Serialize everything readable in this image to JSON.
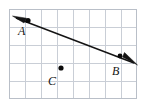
{
  "figure": {
    "colors": {
      "grid_line": "#c9ced6",
      "grid_border": "#b9bfc8",
      "ink": "#141414",
      "background": "#ffffff"
    },
    "grid": {
      "columns": 8,
      "rows": 5,
      "cell_width": 16,
      "cell_height": 18,
      "left": 9,
      "top": 9,
      "right": 137,
      "bottom": 99
    },
    "points": [
      {
        "id": "A",
        "label": "A",
        "x": 28,
        "y": 20,
        "label_x": 18,
        "label_y": 35
      },
      {
        "id": "B",
        "label": "B",
        "x": 120,
        "y": 56,
        "label_x": 112,
        "label_y": 75
      },
      {
        "id": "C",
        "label": "C",
        "x": 61,
        "y": 68,
        "label_x": 48,
        "label_y": 85
      }
    ],
    "line": {
      "name": "line-AB",
      "from_point": "A",
      "to_point": "B",
      "double_headed": true,
      "start_x": 14,
      "start_y": 17,
      "end_x": 136,
      "end_y": 64
    },
    "arrowheads": [
      {
        "id": "arrowhead-left",
        "direction": "upper-left"
      },
      {
        "id": "arrowhead-right",
        "direction": "lower-right"
      }
    ]
  }
}
